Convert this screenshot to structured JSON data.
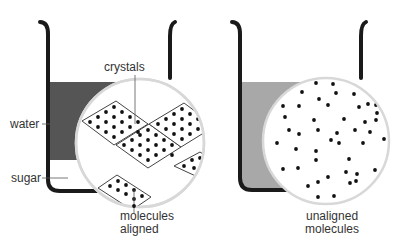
{
  "diagram": {
    "left_panel": {
      "labels": {
        "crystals": "crystals",
        "water": "water",
        "sugar": "sugar",
        "caption_line1": "molecules",
        "caption_line2": "aligned"
      },
      "water_color": "#555555",
      "magnifier": {
        "cx": 140,
        "cy": 143,
        "r": 64
      }
    },
    "right_panel": {
      "labels": {
        "caption_line1": "unaligned",
        "caption_line2": "molecules"
      },
      "water_color": "#a8a8a8",
      "magnifier": {
        "cx": 326,
        "cy": 141,
        "r": 63
      },
      "dots": [
        [
          316,
          83
        ],
        [
          333,
          84
        ],
        [
          302,
          92
        ],
        [
          336,
          93
        ],
        [
          354,
          94
        ],
        [
          319,
          99
        ],
        [
          283,
          106
        ],
        [
          299,
          106
        ],
        [
          328,
          105
        ],
        [
          359,
          107
        ],
        [
          368,
          104
        ],
        [
          376,
          105
        ],
        [
          377,
          113
        ],
        [
          285,
          117
        ],
        [
          314,
          120
        ],
        [
          344,
          119
        ],
        [
          365,
          122
        ],
        [
          376,
          120
        ],
        [
          289,
          130
        ],
        [
          299,
          134
        ],
        [
          318,
          130
        ],
        [
          337,
          133
        ],
        [
          355,
          130
        ],
        [
          370,
          132
        ],
        [
          277,
          143
        ],
        [
          331,
          140
        ],
        [
          339,
          143
        ],
        [
          363,
          143
        ],
        [
          384,
          139
        ],
        [
          296,
          149
        ],
        [
          316,
          151
        ],
        [
          316,
          160
        ],
        [
          349,
          159
        ],
        [
          283,
          169
        ],
        [
          298,
          168
        ],
        [
          346,
          172
        ],
        [
          357,
          174
        ],
        [
          375,
          170
        ],
        [
          328,
          177
        ],
        [
          318,
          182
        ],
        [
          308,
          186
        ],
        [
          350,
          183
        ],
        [
          356,
          181
        ],
        [
          318,
          197
        ],
        [
          334,
          196
        ]
      ]
    },
    "colors": {
      "beaker": "#1a1a1a",
      "magnifier_ring": "#d8d8d8",
      "molecule": "#111111",
      "crystal_edge": "#444444",
      "label_text": "#333333"
    }
  }
}
